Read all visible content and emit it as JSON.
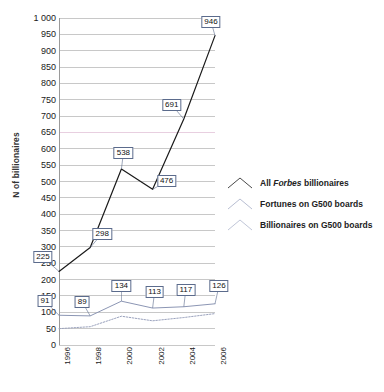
{
  "chart_data": {
    "type": "line",
    "title": "",
    "xlabel": "",
    "ylabel": "N of billionaires",
    "x": [
      1996,
      1997,
      1998,
      1999,
      2000,
      2001,
      2002,
      2003,
      2004,
      2005,
      2006
    ],
    "xtick_labels": [
      "1996",
      "1998",
      "2000",
      "2002",
      "2004",
      "2006"
    ],
    "xticks": [
      1996,
      1998,
      2000,
      2002,
      2004,
      2006
    ],
    "ylim": [
      0,
      1000
    ],
    "ytick_labels": [
      "0",
      "50",
      "100",
      "150",
      "200",
      "250",
      "300",
      "350",
      "400",
      "450",
      "500",
      "550",
      "600",
      "650",
      "700",
      "750",
      "800",
      "850",
      "900",
      "950",
      "1 000"
    ],
    "yticks": [
      0,
      50,
      100,
      150,
      200,
      250,
      300,
      350,
      400,
      450,
      500,
      550,
      600,
      650,
      700,
      750,
      800,
      850,
      900,
      950,
      1000
    ],
    "grid": true,
    "legend_position": "right",
    "series": [
      {
        "name": "All Forbes billionaires",
        "name_italic_word": "Forbes",
        "color": "#1a1a1a",
        "style": "solid",
        "x": [
          1996,
          1998,
          2000,
          2002,
          2004,
          2006
        ],
        "values": [
          225,
          298,
          538,
          476,
          691,
          946
        ],
        "labels": [
          "225",
          "298",
          "538",
          "476",
          "691",
          "946"
        ]
      },
      {
        "name": "Fortunes on G500 boards",
        "color": "#8c96b4",
        "style": "solid",
        "x": [
          1996,
          1998,
          2000,
          2002,
          2004,
          2006
        ],
        "values": [
          91,
          89,
          134,
          113,
          117,
          126
        ],
        "labels": [
          "91",
          "89",
          "134",
          "113",
          "117",
          "126"
        ]
      },
      {
        "name": "Billionaires on G500 boards",
        "color": "#9aa2bd",
        "style": "dotted",
        "x": [
          1996,
          1998,
          2000,
          2002,
          2004,
          2006
        ],
        "values": [
          50,
          56,
          88,
          74,
          84,
          96
        ],
        "labels": []
      }
    ],
    "annotations": [
      {
        "series": "All Forbes billionaires",
        "text": "225",
        "x": 1996,
        "y": 225
      },
      {
        "series": "All Forbes billionaires",
        "text": "298",
        "x": 1998,
        "y": 298
      },
      {
        "series": "All Forbes billionaires",
        "text": "538",
        "x": 2000,
        "y": 538
      },
      {
        "series": "All Forbes billionaires",
        "text": "476",
        "x": 2002,
        "y": 476
      },
      {
        "series": "All Forbes billionaires",
        "text": "691",
        "x": 2004,
        "y": 691
      },
      {
        "series": "All Forbes billionaires",
        "text": "946",
        "x": 2006,
        "y": 946
      },
      {
        "series": "Fortunes on G500 boards",
        "text": "91",
        "x": 1996,
        "y": 91
      },
      {
        "series": "Fortunes on G500 boards",
        "text": "89",
        "x": 1998,
        "y": 89
      },
      {
        "series": "Fortunes on G500 boards",
        "text": "134",
        "x": 2000,
        "y": 134
      },
      {
        "series": "Fortunes on G500 boards",
        "text": "113",
        "x": 2002,
        "y": 113
      },
      {
        "series": "Fortunes on G500 boards",
        "text": "117",
        "x": 2004,
        "y": 117
      },
      {
        "series": "Fortunes on G500 boards",
        "text": "126",
        "x": 2006,
        "y": 126
      }
    ]
  },
  "legend": {
    "items": [
      {
        "label_prefix": "All ",
        "label_italic": "Forbes",
        "label_suffix": " billionaires"
      },
      {
        "label_prefix": "Fortunes on G500 boards",
        "label_italic": "",
        "label_suffix": ""
      },
      {
        "label_prefix": "Billionaires on G500 boards",
        "label_italic": "",
        "label_suffix": ""
      }
    ]
  },
  "colors": {
    "main_line": "#1a1a1a",
    "fortunes_line": "#8c96b4",
    "billionaires_line": "#9aa2bd",
    "gridline": "#c8c8c8",
    "gridline_highlight": "#e8cfe0",
    "callout_border": "#5b6b8c",
    "axis": "#9a9a9a",
    "text": "#1a1a1a"
  }
}
